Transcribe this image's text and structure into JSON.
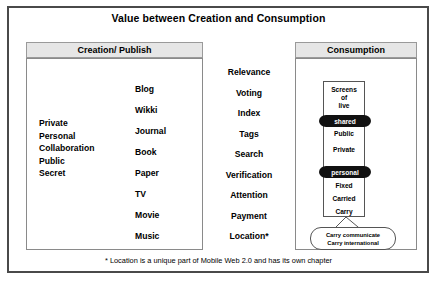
{
  "title": "Value between Creation and Consumption",
  "creation": {
    "header": "Creation/ Publish",
    "attributes": [
      "Private",
      "Personal",
      "Collaboration",
      "Public",
      "Secret"
    ],
    "media": [
      "Blog",
      "Wikki",
      "Journal",
      "Book",
      "Paper",
      "TV",
      "Movie",
      "Music"
    ]
  },
  "values": [
    "Relevance",
    "Voting",
    "Index",
    "Tags",
    "Search",
    "Verification",
    "Attention",
    "Payment",
    "Location*"
  ],
  "consumption": {
    "header": "Consumption",
    "screens_label": [
      "Screens",
      "of",
      "live"
    ],
    "shared_pill": "shared",
    "public": "Public",
    "private": "Private",
    "personal_pill": "personal",
    "fixed": "Fixed",
    "carried": "Carried",
    "carry": "Carry",
    "callout": [
      "Carry communicate",
      "Carry international"
    ]
  },
  "footnote": "* Location is a unique part of Mobile Web 2.0 and has its own chapter",
  "colors": {
    "frame_border": "#4a4a4a",
    "panel_header_bg": "#e6e6e6",
    "pill_bg": "#111111",
    "pill_text": "#ffffff"
  }
}
